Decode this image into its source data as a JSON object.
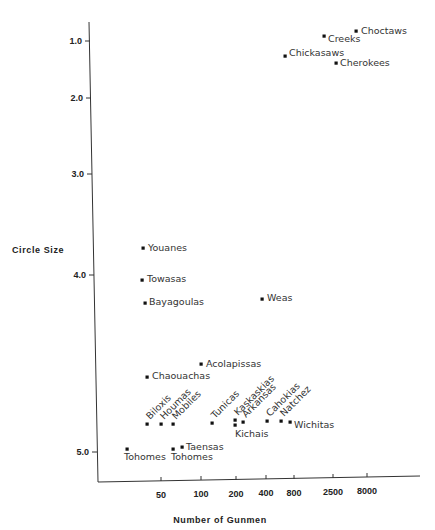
{
  "chart_data": {
    "type": "scatter",
    "title": "",
    "xlabel": "Number of Gunmen",
    "ylabel": "Circle Size",
    "x_scale": "log",
    "x_ticks": [
      50,
      100,
      200,
      400,
      800,
      2500,
      8000
    ],
    "y_ticks": [
      1.0,
      2.0,
      3.0,
      4.0,
      5.0
    ],
    "y_tick_labels": [
      "1.0",
      "2.0",
      "3.0",
      "4.0",
      "5.0"
    ],
    "x_tick_labels": [
      "50",
      "100",
      "200",
      "400",
      "800",
      "2500",
      "8000"
    ],
    "ylim": [
      0.9,
      5.3
    ],
    "grid": false,
    "legend": null,
    "points": [
      {
        "name": "Choctaws",
        "x": 8000,
        "y": 5.15
      },
      {
        "name": "Creeks",
        "x": 3000,
        "y": 5.05
      },
      {
        "name": "Chickasaws",
        "x": 900,
        "y": 4.75
      },
      {
        "name": "Cherokees",
        "x": 4000,
        "y": 4.65
      },
      {
        "name": "Youanes",
        "x": 35,
        "y": 2.3
      },
      {
        "name": "Towasas",
        "x": 35,
        "y": 1.97
      },
      {
        "name": "Bayagoulas",
        "x": 37,
        "y": 1.78
      },
      {
        "name": "Weas",
        "x": 400,
        "y": 1.8
      },
      {
        "name": "Acolapissas",
        "x": 100,
        "y": 1.45
      },
      {
        "name": "Chaouachas",
        "x": 38,
        "y": 1.37
      },
      {
        "name": "Biloxis",
        "x": 38,
        "y": 1.15
      },
      {
        "name": "Houmas",
        "x": 50,
        "y": 1.15
      },
      {
        "name": "Mobiles",
        "x": 62,
        "y": 1.15
      },
      {
        "name": "Tunicas",
        "x": 130,
        "y": 1.16
      },
      {
        "name": "Kaskaskias",
        "x": 200,
        "y": 1.17
      },
      {
        "name": "Kichais",
        "x": 200,
        "y": 1.14
      },
      {
        "name": "Arkansas",
        "x": 240,
        "y": 1.16
      },
      {
        "name": "Cahokias",
        "x": 500,
        "y": 1.17
      },
      {
        "name": "Natchez",
        "x": 700,
        "y": 1.17
      },
      {
        "name": "Wichitas",
        "x": 900,
        "y": 1.16
      },
      {
        "name": "Tohomes",
        "x": 25,
        "y": 1.02
      },
      {
        "name": "Tohomes",
        "x": 60,
        "y": 1.02
      },
      {
        "name": "Taensas",
        "x": 70,
        "y": 1.03
      }
    ]
  },
  "render": {
    "axis": {
      "origin": [
        98,
        482
      ],
      "y_top": [
        89,
        22
      ],
      "x_end": [
        420,
        476
      ]
    },
    "y_tick_px": [
      {
        "label": "5.0",
        "x": 90,
        "y": 41
      },
      {
        "label": "4.0",
        "x": 91,
        "y": 98
      },
      {
        "label": "3.0",
        "x": 92,
        "y": 174
      },
      {
        "label": "2.0",
        "x": 94,
        "y": 275
      },
      {
        "label": "1.0",
        "x": 97,
        "y": 452
      }
    ],
    "x_tick_px": [
      {
        "label": "50",
        "x": 161,
        "y": 481
      },
      {
        "label": "100",
        "x": 201,
        "y": 480
      },
      {
        "label": "200",
        "x": 236,
        "y": 480
      },
      {
        "label": "400",
        "x": 266,
        "y": 479
      },
      {
        "label": "800",
        "x": 294,
        "y": 479
      },
      {
        "label": "2500",
        "x": 333,
        "y": 478
      },
      {
        "label": "8000",
        "x": 367,
        "y": 477
      }
    ],
    "ylabel_pos": [
      12,
      253
    ],
    "xlabel_pos": [
      220,
      523
    ],
    "markers": [
      {
        "name": "Choctaws",
        "mx": 356,
        "my": 31,
        "lx": 361,
        "ly": 34,
        "rot": 0
      },
      {
        "name": "Creeks",
        "mx": 324,
        "my": 36,
        "lx": 328,
        "ly": 42,
        "rot": 0
      },
      {
        "name": "Chickasaws",
        "mx": 285,
        "my": 56,
        "lx": 289,
        "ly": 56,
        "rot": 0
      },
      {
        "name": "Cherokees",
        "mx": 336,
        "my": 63,
        "lx": 340,
        "ly": 66,
        "rot": 0
      },
      {
        "name": "Youanes",
        "mx": 143,
        "my": 248,
        "lx": 148,
        "ly": 251,
        "rot": 0
      },
      {
        "name": "Towasas",
        "mx": 142,
        "my": 280,
        "lx": 147,
        "ly": 282,
        "rot": 0
      },
      {
        "name": "Bayagoulas",
        "mx": 145,
        "my": 303,
        "lx": 149,
        "ly": 305,
        "rot": 0
      },
      {
        "name": "Weas",
        "mx": 262,
        "my": 299,
        "lx": 267,
        "ly": 301,
        "rot": 0
      },
      {
        "name": "Acolapissas",
        "mx": 201,
        "my": 364,
        "lx": 206,
        "ly": 367,
        "rot": 0
      },
      {
        "name": "Chaouachas",
        "mx": 147,
        "my": 377,
        "lx": 152,
        "ly": 379,
        "rot": 0
      },
      {
        "name": "Biloxis",
        "mx": 147,
        "my": 424,
        "lx": 150,
        "ly": 420,
        "rot": -45
      },
      {
        "name": "Houmas",
        "mx": 161,
        "my": 424,
        "lx": 164,
        "ly": 420,
        "rot": -45
      },
      {
        "name": "Mobiles",
        "mx": 173,
        "my": 424,
        "lx": 176,
        "ly": 420,
        "rot": -45
      },
      {
        "name": "Tunicas",
        "mx": 212,
        "my": 423,
        "lx": 215,
        "ly": 419,
        "rot": -45
      },
      {
        "name": "Kaskaskias",
        "mx": 235,
        "my": 420,
        "lx": 238,
        "ly": 416,
        "rot": -45
      },
      {
        "name": "Kichais",
        "mx": 235,
        "my": 425,
        "lx": 235,
        "ly": 437,
        "rot": 0
      },
      {
        "name": "Arkansas",
        "mx": 243,
        "my": 422,
        "lx": 246,
        "ly": 418,
        "rot": -45
      },
      {
        "name": "Cahokias",
        "mx": 267,
        "my": 421,
        "lx": 270,
        "ly": 417,
        "rot": -45
      },
      {
        "name": "Natchez",
        "mx": 281,
        "my": 421,
        "lx": 284,
        "ly": 417,
        "rot": -45
      },
      {
        "name": "Wichitas",
        "mx": 290,
        "my": 422,
        "lx": 294,
        "ly": 428,
        "rot": 0
      },
      {
        "name": "Tohomes",
        "mx": 127,
        "my": 449,
        "lx": 124,
        "ly": 460,
        "rot": 0
      },
      {
        "name": "Tohomes",
        "mx": 173,
        "my": 449,
        "lx": 171,
        "ly": 460,
        "rot": 0
      },
      {
        "name": "Taensas",
        "mx": 182,
        "my": 447,
        "lx": 186,
        "ly": 450,
        "rot": 0
      }
    ]
  }
}
